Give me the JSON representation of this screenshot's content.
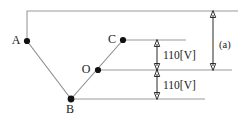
{
  "diagram": {
    "background_color": "#ffffff",
    "line_color": "#8a8a8a",
    "dimension_color": "#2b2b2b",
    "node_color": "#111111",
    "nodes": [
      {
        "id": "A",
        "label": "A",
        "x": 27,
        "y": 41,
        "label_x": 16,
        "label_y": 44
      },
      {
        "id": "C",
        "label": "C",
        "x": 123,
        "y": 40,
        "label_x": 112,
        "label_y": 43
      },
      {
        "id": "O",
        "label": "O",
        "x": 98,
        "y": 70,
        "label_x": 86,
        "label_y": 73
      },
      {
        "id": "B",
        "label": "B",
        "x": 71,
        "y": 99,
        "label_x": 67,
        "label_y": 113
      }
    ],
    "dimensions": [
      {
        "id": "upper-110v",
        "label": "110[V]",
        "value": 110,
        "unit": "[V]",
        "from_y": 40,
        "to_y": 70,
        "x": 157,
        "label_x": 163,
        "label_y": 59
      },
      {
        "id": "lower-110v",
        "label": "110[V]",
        "value": 110,
        "unit": "[V]",
        "from_y": 70,
        "to_y": 99,
        "x": 157,
        "label_x": 163,
        "label_y": 89
      },
      {
        "id": "total-a",
        "label": "(a)",
        "from_y": 11,
        "to_y": 70,
        "x": 213,
        "label_x": 219,
        "label_y": 48
      }
    ]
  }
}
